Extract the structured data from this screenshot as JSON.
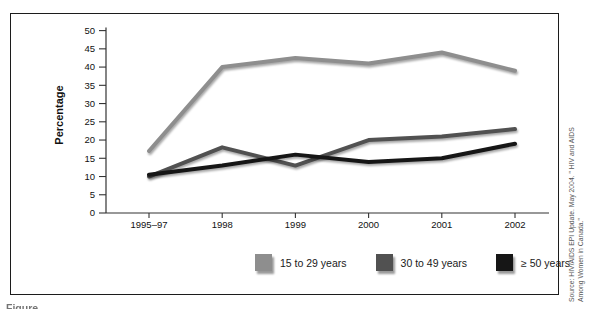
{
  "figure": {
    "source_note_line1": "Source: HIV/AIDS EPI Update. May 2004. \" HIV and AIDS",
    "source_note_line2": "Among Women in Canada.\"",
    "caption_fragment": "Figure"
  },
  "chart_data": {
    "type": "line",
    "title": "",
    "xlabel": "",
    "ylabel": "Percentage",
    "categories": [
      "1995–97",
      "1998",
      "1999",
      "2000",
      "2001",
      "2002"
    ],
    "series": [
      {
        "name": "15 to 29 years",
        "color": "#8e8e8e",
        "values": [
          17,
          40,
          42.5,
          41,
          44,
          39
        ]
      },
      {
        "name": "30 to 49 years",
        "color": "#515151",
        "values": [
          10,
          18,
          13,
          20,
          21,
          23
        ]
      },
      {
        "name": "≥ 50 years",
        "color": "#161616",
        "values": [
          10.5,
          13,
          16,
          14,
          15,
          19
        ]
      }
    ],
    "ylim": [
      0,
      50
    ],
    "ytick_step": 5,
    "grid": false,
    "legend_position": "bottom"
  }
}
